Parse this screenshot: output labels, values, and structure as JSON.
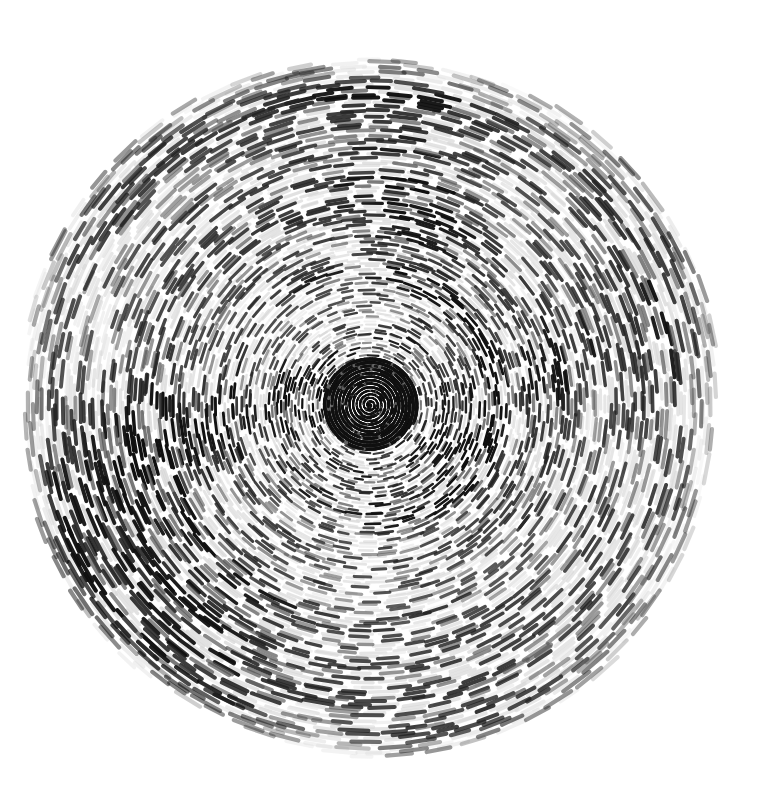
{
  "artwork": {
    "title": "Concentric Dash Disc",
    "medium_note": "ink dashes on white paper",
    "description": "A large circular field built from thousands of short tangential ink dashes arranged along concentric rings, spiralling inward to a dense dark knot at the centre.",
    "background_color": "#ffffff",
    "canvas": {
      "width": 764,
      "height": 798
    },
    "disc": {
      "center_x": 370,
      "center_y": 405,
      "radius": 352,
      "boundary_irregularity": 0.035
    },
    "ink_palette": {
      "darkest": "#101010",
      "dark": "#242424",
      "mid": "#555555",
      "light": "#9a9a9a",
      "ghost": "#d8d8d8",
      "faintest": "#ececec"
    },
    "stroke_model": {
      "ring_count": 120,
      "inner_dash_length_px": 3.5,
      "outer_dash_length_px": 26,
      "inner_stroke_width_px": 1.6,
      "outer_stroke_width_px": 4.2,
      "gap_ratio": 0.45,
      "angular_jitter": 0.22,
      "radial_jitter_px": 2.6,
      "core_radius_px": 46,
      "core_darkness": 0.95
    },
    "value_field": {
      "type": "mottled-radial-clusters",
      "angular_lobes": 7,
      "radial_bands": 9,
      "dark_fraction": 0.42,
      "ghost_fraction": 0.33
    },
    "chart_data": {
      "type": "scatter",
      "title": "Concentric Dash Disc",
      "xlabel": "",
      "ylabel": "",
      "grid": false,
      "legend": "none",
      "xlim": [
        0,
        764
      ],
      "ylim": [
        798,
        0
      ],
      "series": [
        {
          "name": "dark dashes",
          "color": "#1d1d1d",
          "approx_count": 5200
        },
        {
          "name": "ghost dashes",
          "color": "#d5d5d5",
          "approx_count": 4100
        }
      ],
      "annotations": []
    }
  },
  "accessibility": {
    "alt_text": "Abstract circular drawing of concentric rings of short dark and pale ink dashes, densest and darkest at the centre, fading to an irregular edge on white paper."
  }
}
